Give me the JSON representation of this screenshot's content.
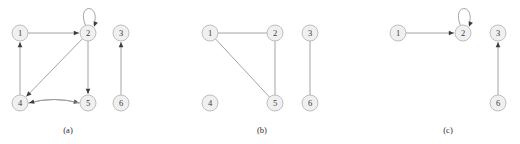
{
  "figure": {
    "width": 520,
    "height": 144,
    "background_color": "#ffffff",
    "node_fill_color": "#f0f0f0",
    "node_stroke_color": "#b8b8b8",
    "edge_color": "#9a9a9a",
    "arrow_color": "#3c3c3c",
    "label_color": "#3a3a3a",
    "node_radius": 8
  },
  "panels": [
    {
      "id": "panel-a",
      "caption": "(a)",
      "caption_x": 68,
      "caption_y": 130,
      "directed": true,
      "nodes": [
        {
          "id": "1",
          "label": "1",
          "x": 20,
          "y": 33
        },
        {
          "id": "2",
          "label": "2",
          "x": 88,
          "y": 33
        },
        {
          "id": "3",
          "label": "3",
          "x": 121,
          "y": 33
        },
        {
          "id": "4",
          "label": "4",
          "x": 20,
          "y": 103
        },
        {
          "id": "5",
          "label": "5",
          "x": 88,
          "y": 103
        },
        {
          "id": "6",
          "label": "6",
          "x": 121,
          "y": 103
        }
      ],
      "edges": [
        {
          "from": "1",
          "to": "2",
          "kind": "straight",
          "directed": true
        },
        {
          "from": "2",
          "to": "2",
          "kind": "self-loop",
          "directed": true
        },
        {
          "from": "2",
          "to": "4",
          "kind": "straight",
          "directed": true
        },
        {
          "from": "2",
          "to": "5",
          "kind": "straight",
          "directed": true
        },
        {
          "from": "4",
          "to": "1",
          "kind": "straight",
          "directed": true
        },
        {
          "from": "4",
          "to": "5",
          "kind": "curve-up",
          "directed": true
        },
        {
          "from": "5",
          "to": "4",
          "kind": "curve-down",
          "directed": true
        },
        {
          "from": "6",
          "to": "3",
          "kind": "straight",
          "directed": true
        }
      ]
    },
    {
      "id": "panel-b",
      "caption": "(b)",
      "caption_x": 262,
      "caption_y": 130,
      "directed": false,
      "nodes": [
        {
          "id": "1",
          "label": "1",
          "x": 210,
          "y": 33
        },
        {
          "id": "2",
          "label": "2",
          "x": 275,
          "y": 33
        },
        {
          "id": "3",
          "label": "3",
          "x": 310,
          "y": 33
        },
        {
          "id": "4",
          "label": "4",
          "x": 210,
          "y": 103
        },
        {
          "id": "5",
          "label": "5",
          "x": 275,
          "y": 103
        },
        {
          "id": "6",
          "label": "6",
          "x": 310,
          "y": 103
        }
      ],
      "edges": [
        {
          "from": "1",
          "to": "2",
          "kind": "straight",
          "directed": false
        },
        {
          "from": "1",
          "to": "5",
          "kind": "straight",
          "directed": false
        },
        {
          "from": "2",
          "to": "5",
          "kind": "straight",
          "directed": false
        },
        {
          "from": "3",
          "to": "6",
          "kind": "straight",
          "directed": false
        }
      ]
    },
    {
      "id": "panel-c",
      "caption": "(c)",
      "caption_x": 448,
      "caption_y": 130,
      "directed": true,
      "nodes": [
        {
          "id": "1",
          "label": "1",
          "x": 398,
          "y": 33
        },
        {
          "id": "2",
          "label": "2",
          "x": 463,
          "y": 33
        },
        {
          "id": "3",
          "label": "3",
          "x": 498,
          "y": 33
        },
        {
          "id": "6",
          "label": "6",
          "x": 498,
          "y": 103
        }
      ],
      "edges": [
        {
          "from": "1",
          "to": "2",
          "kind": "straight",
          "directed": true
        },
        {
          "from": "2",
          "to": "2",
          "kind": "self-loop",
          "directed": true
        },
        {
          "from": "6",
          "to": "3",
          "kind": "straight",
          "directed": true
        }
      ]
    }
  ]
}
